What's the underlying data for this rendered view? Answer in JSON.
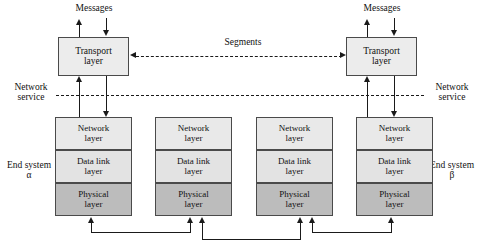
{
  "figure": {
    "colors": {
      "network_layer_fill": "#e9e9e9",
      "data_link_layer_fill": "#e3e3e3",
      "physical_layer_fill": "#bcbcbc",
      "transport_layer_fill": "#ececec",
      "line": "#1a1a1a",
      "border": "#4a4a4a",
      "background": "#ffffff"
    }
  },
  "labels": {
    "messages_left": "Messages",
    "messages_right": "Messages",
    "segments": "Segments",
    "network_service_left_line1": "Network",
    "network_service_left_line2": "service",
    "network_service_right_line1": "Network",
    "network_service_right_line2": "service",
    "end_system_left_line1": "End system",
    "end_system_left_line2": "α",
    "end_system_right_line1": "End system",
    "end_system_right_line2": "β"
  },
  "stacks": [
    {
      "id": "stack-1",
      "role": "end-system-alpha",
      "has_transport": true,
      "transport": {
        "line1": "Transport",
        "line2": "layer"
      },
      "layers": [
        {
          "name": "network-layer",
          "line1": "Network",
          "line2": "layer"
        },
        {
          "name": "data-link-layer",
          "line1": "Data link",
          "line2": "layer"
        },
        {
          "name": "physical-layer",
          "line1": "Physical",
          "line2": "layer"
        }
      ]
    },
    {
      "id": "stack-2",
      "role": "intermediate-node",
      "has_transport": false,
      "layers": [
        {
          "name": "network-layer",
          "line1": "Network",
          "line2": "layer"
        },
        {
          "name": "data-link-layer",
          "line1": "Data link",
          "line2": "layer"
        },
        {
          "name": "physical-layer",
          "line1": "Physical",
          "line2": "layer"
        }
      ]
    },
    {
      "id": "stack-3",
      "role": "intermediate-node",
      "has_transport": false,
      "layers": [
        {
          "name": "network-layer",
          "line1": "Network",
          "line2": "layer"
        },
        {
          "name": "data-link-layer",
          "line1": "Data link",
          "line2": "layer"
        },
        {
          "name": "physical-layer",
          "line1": "Physical",
          "line2": "layer"
        }
      ]
    },
    {
      "id": "stack-4",
      "role": "end-system-beta",
      "has_transport": true,
      "transport": {
        "line1": "Transport",
        "line2": "layer"
      },
      "layers": [
        {
          "name": "network-layer",
          "line1": "Network",
          "line2": "layer"
        },
        {
          "name": "data-link-layer",
          "line1": "Data link",
          "line2": "layer"
        },
        {
          "name": "physical-layer",
          "line1": "Physical",
          "line2": "layer"
        }
      ]
    }
  ]
}
